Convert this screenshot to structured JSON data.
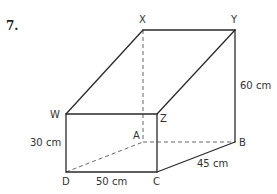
{
  "question": {
    "number": "7."
  },
  "vertices": {
    "W": {
      "label": "W",
      "x": 66,
      "y": 114
    },
    "X": {
      "label": "X",
      "x": 143,
      "y": 30
    },
    "Y": {
      "label": "Y",
      "x": 235,
      "y": 30
    },
    "Z": {
      "label": "Z",
      "x": 157,
      "y": 114
    },
    "D": {
      "label": "D",
      "x": 66,
      "y": 172
    },
    "C": {
      "label": "C",
      "x": 157,
      "y": 172
    },
    "A": {
      "label": "A",
      "x": 143,
      "y": 142
    },
    "B": {
      "label": "B",
      "x": 235,
      "y": 142
    }
  },
  "dimensions": {
    "height_front": "30 cm",
    "width_front": "50 cm",
    "depth": "45 cm",
    "height_back": "60 cm"
  },
  "colors": {
    "line": "#2a2a2a",
    "hidden_line": "#555555",
    "text": "#333333"
  }
}
